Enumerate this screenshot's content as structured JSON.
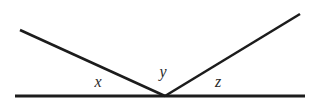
{
  "figure": {
    "background_color": "#ffffff",
    "line_color": "#1c1c1c",
    "label_color": "#2a2a2a",
    "width": 320,
    "height": 105
  },
  "labels": {
    "left_angle": "x",
    "vertex_angle": "y",
    "right_angle": "z"
  },
  "geometry": {
    "vertex": {
      "x": 165,
      "y": 96
    },
    "baseline": {
      "x1": 15,
      "y1": 96,
      "x2": 305,
      "y2": 96
    },
    "left_ray": {
      "x1": 20,
      "y1": 30,
      "x2": 165,
      "y2": 96
    },
    "right_ray": {
      "x1": 165,
      "y1": 96,
      "x2": 300,
      "y2": 14
    },
    "label_positions": {
      "left_angle": {
        "x": 98,
        "y": 82
      },
      "vertex_angle": {
        "x": 163,
        "y": 72
      },
      "right_angle": {
        "x": 218,
        "y": 82
      }
    }
  }
}
